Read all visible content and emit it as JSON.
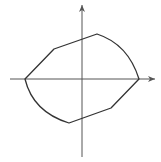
{
  "diagram": {
    "type": "closed-curve-on-axes",
    "colors": {
      "background": "#ffffff",
      "axis": "#555555",
      "curve": "#333333"
    },
    "axes": {
      "origin": [
        82,
        79
      ],
      "x_axis": {
        "from": [
          10,
          79
        ],
        "to": [
          155,
          79
        ],
        "arrow": "right"
      },
      "y_axis": {
        "from": [
          82,
          157
        ],
        "to": [
          82,
          5
        ],
        "arrow": "up"
      }
    },
    "curve_path": "M25,79 L54,49 L97,34 Q128,44 139,79 L111,108 L69,123 Q33,112 25,79 Z"
  }
}
